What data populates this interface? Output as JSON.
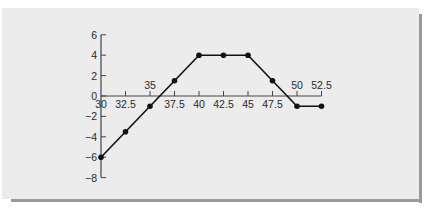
{
  "chart_data": {
    "type": "line",
    "title": "",
    "xlabel": "",
    "ylabel": "",
    "x": [
      30,
      32.5,
      35,
      37.5,
      40,
      42.5,
      45,
      47.5,
      50,
      52.5
    ],
    "series": [
      {
        "name": "profit",
        "values": [
          -6,
          -3.5,
          -1,
          1.5,
          4,
          4,
          4,
          1.5,
          -1,
          -1
        ]
      }
    ],
    "xticks": [
      30,
      32.5,
      35,
      37.5,
      40,
      42.5,
      45,
      47.5,
      50,
      52.5
    ],
    "xtick_labels": [
      "30",
      "32.5",
      "35",
      "37.5",
      "40",
      "42.5",
      "45",
      "47.5",
      "50",
      "52.5"
    ],
    "yticks": [
      6,
      4,
      2,
      0,
      -2,
      -4,
      -6,
      -8
    ],
    "ytick_labels": [
      "6",
      "4",
      "2",
      "0",
      "−2",
      "−4",
      "−6",
      "−8"
    ],
    "xlim": [
      30,
      52.5
    ],
    "ylim": [
      -8,
      6
    ],
    "grid": false,
    "legend": "none",
    "markers": true,
    "colors": {
      "line": "#111111",
      "axis": "#444444",
      "panel": "#ececec",
      "shadow": "#9a9a9a"
    }
  }
}
